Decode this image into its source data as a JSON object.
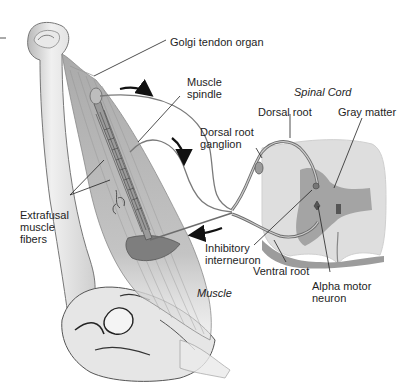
{
  "diagram": {
    "title": "Spinal Cord",
    "regions": {
      "muscle": "Muscle",
      "spinal_cord": "Spinal Cord"
    },
    "labels": {
      "golgi": "Golgi tendon organ",
      "spindle": "Muscle\nspindle",
      "drg": "Dorsal root\nganglion",
      "dorsal_root": "Dorsal root",
      "gray_matter": "Gray matter",
      "extrafusal": "Extrafusal\nmuscle\nfibers",
      "inhibitory": "Inhibitory\ninterneuron",
      "ventral_root": "Ventral root",
      "alpha": "Alpha motor\nneuron",
      "muscle": "Muscle",
      "spinal_cord": "Spinal Cord"
    },
    "colors": {
      "background": "#ffffff",
      "text": "#1e1e1e",
      "bone": "#dcdcdc",
      "muscle": "#a9a9a9",
      "nerve": "#7a7a7a",
      "white_matter": "#e4e4e4",
      "gray_matter": "#a0a0a0"
    }
  }
}
